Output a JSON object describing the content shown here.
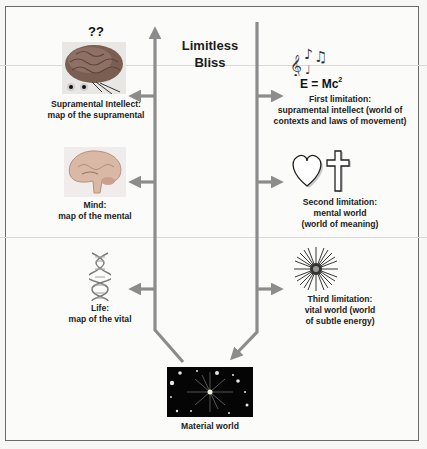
{
  "center": {
    "title_line1": "Limitless",
    "title_line2": "Bliss"
  },
  "left_column": {
    "items": [
      {
        "icon": "brain-photo-icon",
        "caption_line1": "Supramental Intellect:",
        "caption_line2": "map of the supramental",
        "annotation": "??"
      },
      {
        "icon": "brain-cross-section-icon",
        "caption_line1": "Mind:",
        "caption_line2": "map of the mental"
      },
      {
        "icon": "dna-helix-icon",
        "caption_line1": "Life:",
        "caption_line2": "map of the vital"
      }
    ]
  },
  "right_column": {
    "items": [
      {
        "icon": "music-notes-icon",
        "formula_base": "E = Mc",
        "formula_exp": "2",
        "caption_line1": "First limitation:",
        "caption_line2": "supramental intellect (world of",
        "caption_line3": "contexts and laws of movement)"
      },
      {
        "icon": "heart-and-cross-icon",
        "caption_line1": "Second limitation:",
        "caption_line2": "mental world",
        "caption_line3": "(world of meaning)"
      },
      {
        "icon": "starburst-icon",
        "caption_line1": "Third limitation:",
        "caption_line2": "vital world (world",
        "caption_line3": "of subtle energy)"
      }
    ]
  },
  "bottom": {
    "icon": "starfield-icon",
    "caption": "Material world"
  },
  "colors": {
    "arrow": "#8c8c8c",
    "frame": "#6b6b6b",
    "background": "#fbfbf9"
  }
}
